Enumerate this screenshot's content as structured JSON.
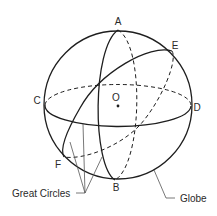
{
  "diagram": {
    "points": {
      "A": "A",
      "B": "B",
      "C": "C",
      "D": "D",
      "E": "E",
      "F": "F",
      "O": "O"
    },
    "callouts": {
      "great_circles": "Great Circles",
      "globe": "Globe"
    },
    "colors": {
      "line": "#1e1e1e",
      "pointer": "#555555",
      "text": "#2a2a2a",
      "background": "#ffffff"
    }
  }
}
